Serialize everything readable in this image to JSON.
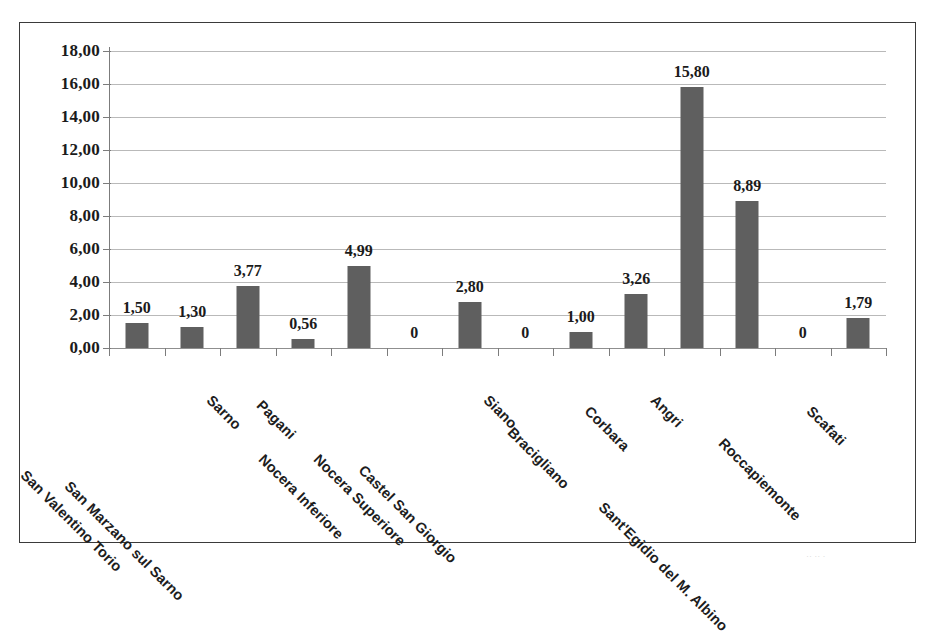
{
  "chart_data": {
    "type": "bar",
    "title": "",
    "subtitle": "",
    "xlabel": "",
    "ylabel": "",
    "ylim": [
      0,
      18
    ],
    "ytick_step": 2,
    "grid": true,
    "legend": false,
    "orientation": "vertical",
    "bar_color": "#5f5f5f",
    "background_color": "#ffffff",
    "gridline_color": "#b9b9b9",
    "decimal_separator": ",",
    "categories": [
      "San Valentino Torio",
      "San Marzano sul Sarno",
      "Sarno",
      "Pagani",
      "Nocera Inferiore",
      "Nocera Superiore",
      "Castel San Giorgio",
      "Siano",
      "Bracigliano",
      "Corbara",
      "Angri",
      "Sant'Egidio del M. Albino",
      "Roccapiemonte",
      "Scafati"
    ],
    "values": [
      1.5,
      1.3,
      3.77,
      0.56,
      4.99,
      0,
      2.8,
      0,
      1.0,
      3.26,
      15.8,
      8.89,
      0,
      1.79
    ],
    "data_labels": [
      "1,50",
      "1,30",
      "3,77",
      "0,56",
      "4,99",
      "0",
      "2,80",
      "0",
      "1,00",
      "3,26",
      "15,80",
      "8,89",
      "0",
      "1,79"
    ],
    "ytick_labels": [
      "18,00",
      "16,00",
      "14,00",
      "12,00",
      "10,00",
      "8,00",
      "6,00",
      "4,00",
      "2,00",
      "0,00"
    ],
    "ytick_values": [
      18,
      16,
      14,
      12,
      10,
      8,
      6,
      4,
      2,
      0
    ]
  }
}
